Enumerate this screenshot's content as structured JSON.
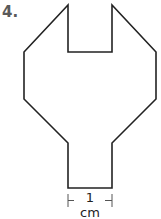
{
  "problem": {
    "number": "4."
  },
  "figure": {
    "shape": "wrench-like polygon",
    "stroke_color": "#222222",
    "points": [
      [
        68,
        5
      ],
      [
        68,
        52
      ],
      [
        112,
        52
      ],
      [
        112,
        5
      ],
      [
        156,
        52
      ],
      [
        156,
        99
      ],
      [
        112,
        143
      ],
      [
        112,
        188
      ],
      [
        68,
        188
      ],
      [
        68,
        143
      ],
      [
        24,
        99
      ],
      [
        24,
        52
      ]
    ],
    "dimension": {
      "label": "1 cm",
      "x_start": 68,
      "x_end": 112,
      "y": 200
    }
  }
}
